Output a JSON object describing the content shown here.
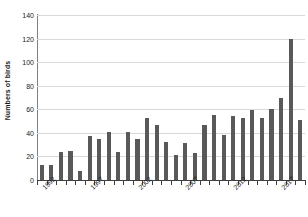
{
  "chart_data": {
    "type": "bar",
    "title": "",
    "xlabel": "",
    "ylabel": "Numbers of birds",
    "ylim": [
      0,
      140
    ],
    "yticks": [
      0,
      20,
      40,
      60,
      80,
      100,
      120,
      140
    ],
    "grid": true,
    "legend": false,
    "bar_color": "#595959",
    "gridline_color": "#d9d9d9",
    "axis_color": "#404040",
    "categories": [
      "1992",
      "1993",
      "1994",
      "1995",
      "1996",
      "1997",
      "1998",
      "1999",
      "2000",
      "2001",
      "2002",
      "2003",
      "2004",
      "2005",
      "2006",
      "2007",
      "2008",
      "2009",
      "2010",
      "2011",
      "2012",
      "2013",
      "2014",
      "2015",
      "2016",
      "2017",
      "2018",
      "2019"
    ],
    "values": [
      13,
      13,
      24,
      25,
      8,
      37,
      35,
      41,
      24,
      41,
      35,
      53,
      47,
      32,
      21,
      31,
      23,
      47,
      55,
      38,
      54,
      53,
      59,
      53,
      60,
      70,
      120,
      51
    ],
    "visible_xtick_labels": [
      "1992",
      "1997",
      "2002",
      "2007",
      "2012",
      "2017"
    ],
    "xtick_label_indices": [
      0,
      5,
      10,
      15,
      20,
      25
    ]
  }
}
